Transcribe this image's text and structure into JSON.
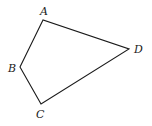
{
  "diagram": {
    "type": "quadrilateral",
    "vertices": [
      {
        "label": "A",
        "x": 43,
        "y": 20,
        "lx": 40,
        "ly": 15
      },
      {
        "label": "B",
        "x": 20,
        "y": 67,
        "lx": 8,
        "ly": 72
      },
      {
        "label": "C",
        "x": 41,
        "y": 104,
        "lx": 36,
        "ly": 118
      },
      {
        "label": "D",
        "x": 129,
        "y": 49,
        "lx": 134,
        "ly": 53
      }
    ],
    "edges": [
      "AB",
      "BC",
      "CD",
      "DA"
    ],
    "stroke_color": "#1a1a1a"
  }
}
